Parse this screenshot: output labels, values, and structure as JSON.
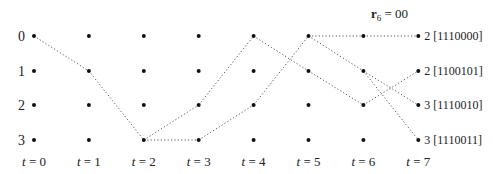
{
  "title": {
    "bold": "r",
    "sub": "6",
    "rest": " = 00"
  },
  "states": [
    "0",
    "1",
    "2",
    "3"
  ],
  "times": [
    "t = 0",
    "t = 1",
    "t = 2",
    "t = 3",
    "t = 4",
    "t = 5",
    "t = 6",
    "t = 7"
  ],
  "num_times": 8,
  "num_states": 4,
  "edges": [
    {
      "from": [
        0,
        0
      ],
      "to": [
        1,
        1
      ]
    },
    {
      "from": [
        1,
        1
      ],
      "to": [
        2,
        3
      ]
    },
    {
      "from": [
        2,
        3
      ],
      "to": [
        3,
        2
      ]
    },
    {
      "from": [
        2,
        3
      ],
      "to": [
        3,
        3
      ]
    },
    {
      "from": [
        3,
        2
      ],
      "to": [
        4,
        0
      ]
    },
    {
      "from": [
        3,
        3
      ],
      "to": [
        4,
        2
      ]
    },
    {
      "from": [
        4,
        2
      ],
      "to": [
        5,
        0
      ]
    },
    {
      "from": [
        4,
        0
      ],
      "to": [
        5,
        1
      ]
    },
    {
      "from": [
        5,
        1
      ],
      "to": [
        6,
        2
      ]
    },
    {
      "from": [
        5,
        0
      ],
      "to": [
        6,
        0
      ]
    },
    {
      "from": [
        5,
        0
      ],
      "to": [
        6,
        1
      ]
    },
    {
      "from": [
        6,
        0
      ],
      "to": [
        7,
        0
      ]
    },
    {
      "from": [
        6,
        1
      ],
      "to": [
        7,
        2
      ]
    },
    {
      "from": [
        6,
        1
      ],
      "to": [
        7,
        3
      ]
    },
    {
      "from": [
        6,
        2
      ],
      "to": [
        7,
        1
      ]
    }
  ],
  "end_labels": [
    {
      "state": 0,
      "text": "2 [1110000]"
    },
    {
      "state": 1,
      "text": "2 [1100101]"
    },
    {
      "state": 2,
      "text": "3 [1110010]"
    },
    {
      "state": 3,
      "text": "3 [1110011]"
    }
  ]
}
